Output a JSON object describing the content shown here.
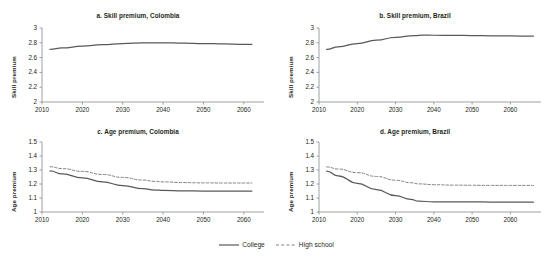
{
  "figure": {
    "supertitle": "",
    "legend": [
      {
        "label": "College",
        "style": "solid",
        "color": "#58595b"
      },
      {
        "label": "High school",
        "style": "dashed",
        "color": "#808285"
      }
    ]
  },
  "chart_data": [
    {
      "id": "a",
      "type": "line",
      "title": "a. Skill premium, Colombia",
      "xlabel": "",
      "ylabel": "Skill premium",
      "xlim": [
        2010,
        2065
      ],
      "ylim": [
        2,
        3
      ],
      "xticks": [
        2010,
        2020,
        2030,
        2040,
        2050,
        2060
      ],
      "yticks": [
        2,
        2.2,
        2.4,
        2.6,
        2.8,
        3
      ],
      "ytick_labels": [
        "2",
        "2.2",
        "2.4",
        "2.6",
        "2.8",
        "3"
      ],
      "grid": false,
      "legend_position": "figure-bottom",
      "series": [
        {
          "name": "College",
          "style": "solid",
          "color": "#58595b",
          "x": [
            2012,
            2015,
            2020,
            2025,
            2030,
            2035,
            2037,
            2040,
            2045,
            2050,
            2055,
            2060,
            2062
          ],
          "values": [
            2.71,
            2.73,
            2.755,
            2.775,
            2.79,
            2.798,
            2.8,
            2.8,
            2.795,
            2.79,
            2.785,
            2.78,
            2.78
          ]
        }
      ]
    },
    {
      "id": "b",
      "type": "line",
      "title": "b. Skill premium, Brazil",
      "xlabel": "",
      "ylabel": "Skill premium",
      "xlim": [
        2010,
        2068
      ],
      "ylim": [
        2,
        3
      ],
      "xticks": [
        2010,
        2020,
        2030,
        2040,
        2050,
        2060
      ],
      "yticks": [
        2,
        2.2,
        2.4,
        2.6,
        2.8,
        3
      ],
      "ytick_labels": [
        "2",
        "2.2",
        "2.4",
        "2.6",
        "2.8",
        "3"
      ],
      "grid": false,
      "legend_position": "figure-bottom",
      "series": [
        {
          "name": "College",
          "style": "solid",
          "color": "#58595b",
          "x": [
            2012,
            2015,
            2020,
            2025,
            2030,
            2035,
            2037,
            2040,
            2045,
            2050,
            2055,
            2060,
            2066
          ],
          "values": [
            2.71,
            2.745,
            2.79,
            2.835,
            2.875,
            2.898,
            2.903,
            2.902,
            2.9,
            2.898,
            2.895,
            2.892,
            2.89
          ]
        }
      ]
    },
    {
      "id": "c",
      "type": "line",
      "title": "c. Age premium, Colombia",
      "xlabel": "",
      "ylabel": "Age premium",
      "xlim": [
        2010,
        2065
      ],
      "ylim": [
        1,
        1.5
      ],
      "xticks": [
        2010,
        2020,
        2030,
        2040,
        2050,
        2060
      ],
      "yticks": [
        1,
        1.1,
        1.2,
        1.3,
        1.4,
        1.5
      ],
      "ytick_labels": [
        "1",
        "1.1",
        "1.2",
        "1.3",
        "1.4",
        "1.5"
      ],
      "grid": false,
      "legend_position": "figure-bottom",
      "series": [
        {
          "name": "College",
          "style": "solid",
          "color": "#58595b",
          "x": [
            2012,
            2015,
            2020,
            2025,
            2030,
            2035,
            2038,
            2040,
            2045,
            2050,
            2055,
            2060,
            2062
          ],
          "values": [
            1.293,
            1.272,
            1.243,
            1.215,
            1.189,
            1.167,
            1.157,
            1.154,
            1.151,
            1.15,
            1.15,
            1.15,
            1.15
          ]
        },
        {
          "name": "High school",
          "style": "dashed",
          "color": "#808285",
          "x": [
            2012,
            2015,
            2020,
            2025,
            2030,
            2035,
            2038,
            2040,
            2045,
            2050,
            2055,
            2060,
            2062
          ],
          "values": [
            1.323,
            1.31,
            1.29,
            1.268,
            1.247,
            1.228,
            1.219,
            1.215,
            1.21,
            1.208,
            1.207,
            1.207,
            1.207
          ]
        }
      ]
    },
    {
      "id": "d",
      "type": "line",
      "title": "d. Age premium, Brazil",
      "xlabel": "",
      "ylabel": "Age premium",
      "xlim": [
        2010,
        2068
      ],
      "ylim": [
        1,
        1.5
      ],
      "xticks": [
        2010,
        2020,
        2030,
        2040,
        2050,
        2060
      ],
      "yticks": [
        1,
        1.1,
        1.2,
        1.3,
        1.4,
        1.5
      ],
      "ytick_labels": [
        "1",
        "1.1",
        "1.2",
        "1.3",
        "1.4",
        "1.5"
      ],
      "grid": false,
      "legend_position": "figure-bottom",
      "series": [
        {
          "name": "College",
          "style": "solid",
          "color": "#58595b",
          "x": [
            2012,
            2015,
            2020,
            2025,
            2030,
            2034,
            2036,
            2040,
            2045,
            2050,
            2055,
            2060,
            2066
          ],
          "values": [
            1.292,
            1.258,
            1.205,
            1.159,
            1.117,
            1.09,
            1.077,
            1.073,
            1.072,
            1.072,
            1.071,
            1.071,
            1.07
          ]
        },
        {
          "name": "High school",
          "style": "dashed",
          "color": "#808285",
          "x": [
            2012,
            2015,
            2020,
            2025,
            2030,
            2034,
            2036,
            2040,
            2045,
            2050,
            2055,
            2060,
            2066
          ],
          "values": [
            1.322,
            1.307,
            1.281,
            1.254,
            1.227,
            1.209,
            1.201,
            1.195,
            1.192,
            1.191,
            1.19,
            1.19,
            1.19
          ]
        }
      ]
    }
  ]
}
